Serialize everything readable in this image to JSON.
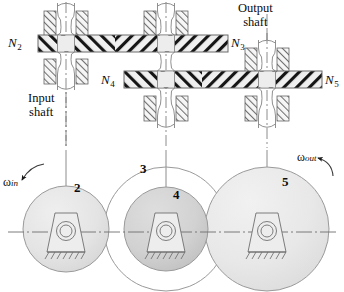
{
  "figure": {
    "background_color": "#ffffff",
    "line_color": "#111111",
    "width": 344,
    "height": 292
  },
  "shaft_labels": {
    "input": "Input\nshaft",
    "input_line1": "Input",
    "input_line2": "shaft",
    "output": "Output\nshaft",
    "output_line1": "Output",
    "output_line2": "shaft"
  },
  "gear_labels": [
    {
      "id": "N2",
      "text": "N",
      "sub": "2",
      "x": 8,
      "y": 39
    },
    {
      "id": "N3",
      "text": "N",
      "sub": "3",
      "x": 227,
      "y": 39
    },
    {
      "id": "N4",
      "text": "N",
      "sub": "4",
      "x": 100,
      "y": 79
    },
    {
      "id": "N5",
      "text": "N",
      "sub": "5",
      "x": 323,
      "y": 79
    }
  ],
  "gear_numbers": [
    {
      "id": "2",
      "label": "2",
      "x": 75,
      "y": 188
    },
    {
      "id": "3",
      "label": "3",
      "x": 141,
      "y": 168
    },
    {
      "id": "4",
      "label": "4",
      "x": 174,
      "y": 195
    },
    {
      "id": "5",
      "label": "5",
      "x": 283,
      "y": 182
    }
  ],
  "angular_velocities": [
    {
      "id": "omega-in",
      "symbol": "ω",
      "sub": "in",
      "x": 4,
      "y": 175
    },
    {
      "id": "omega-out",
      "symbol": "ω",
      "sub": "out",
      "x": 298,
      "y": 152
    }
  ],
  "gears": {
    "gear2": {
      "cx": 66,
      "cy": 229,
      "r": 43,
      "fill": "#e3e3e3",
      "stroke": "#8c8c8c",
      "filled": true
    },
    "gear3": {
      "cx": 166,
      "cy": 229,
      "r": 62,
      "fill": "none",
      "stroke": "#8c8c8c",
      "filled": false
    },
    "gear4": {
      "cx": 166,
      "cy": 229,
      "r": 42,
      "fill": "#d0d0d0",
      "stroke": "#8c8c8c",
      "filled": true
    },
    "gear5": {
      "cx": 267,
      "cy": 229,
      "r": 62,
      "fill": "#e6e6e6",
      "stroke": "#8c8c8c",
      "filled": true
    }
  },
  "shafts": {
    "input": {
      "x": 66,
      "top": 0,
      "bottom": 292
    },
    "middle": {
      "x": 166,
      "top": 0,
      "bottom": 292
    },
    "output": {
      "x": 267,
      "top": 0,
      "bottom": 292
    }
  },
  "gear_bands": [
    {
      "id": "band-N2-N3",
      "x": 38,
      "y": 35,
      "width": 190,
      "height": 17,
      "fill": "#eeeeee"
    },
    {
      "id": "band-N4-N5",
      "x": 124,
      "y": 71,
      "width": 198,
      "height": 17,
      "fill": "#eeeeee"
    }
  ],
  "colors": {
    "band_fill": "#eeeeee",
    "gear_light": "#e3e3e3",
    "gear_mid": "#d0d0d0",
    "gear_pale": "#e6e6e6",
    "hatch": "#1a1a1a",
    "outline": "#8c8c8c",
    "centerline": "#7a7a7a"
  }
}
